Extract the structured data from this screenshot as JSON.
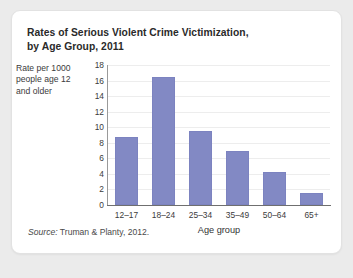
{
  "figure": {
    "title_line1": "Rates of Serious Violent Crime Victimization,",
    "title_line2": "by Age Group, 2011",
    "source_label": "Source:",
    "source_text": " Truman & Planty, 2012."
  },
  "chart_data": {
    "type": "bar",
    "title": "Rates of Serious Violent Crime Victimization, by Age Group, 2011",
    "xlabel": "Age group",
    "ylabel": "Rate per 1000 people age 12 and older",
    "ylabel_line1": "Rate per 1000",
    "ylabel_line2": "people age 12",
    "ylabel_line3": "and older",
    "categories": [
      "12–17",
      "18–24",
      "25–34",
      "35–49",
      "50–64",
      "65+"
    ],
    "values": [
      8.8,
      16.4,
      9.5,
      7.0,
      4.3,
      1.6
    ],
    "ylim": [
      0,
      18
    ],
    "ytick_step": 2,
    "yticks": [
      0,
      2,
      4,
      6,
      8,
      10,
      12,
      14,
      16,
      18
    ],
    "grid": true,
    "legend": false,
    "bar_color": "#8289c4",
    "gridline_color": "#ededed",
    "axis_color": "#6f6f6f"
  }
}
